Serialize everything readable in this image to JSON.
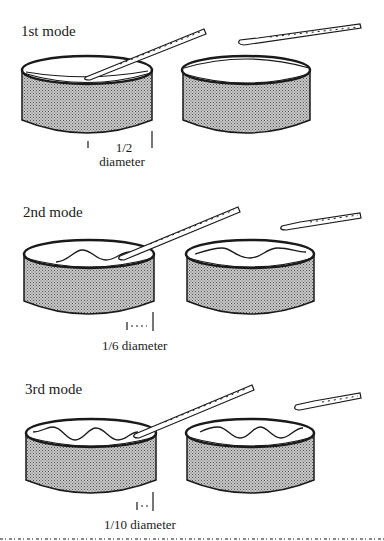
{
  "figure": {
    "modes": [
      {
        "title": "1st mode",
        "measure_label_top": "1/2",
        "measure_label_bottom": "diameter",
        "waves": 1
      },
      {
        "title": "2nd mode",
        "measure_label": "1/6 diameter",
        "waves": 2
      },
      {
        "title": "3rd mode",
        "measure_label": "1/10 diameter",
        "waves": 3
      }
    ],
    "colors": {
      "ink": "#1a1a1a",
      "shading": "#a8a8a8",
      "background": "#ffffff"
    }
  }
}
